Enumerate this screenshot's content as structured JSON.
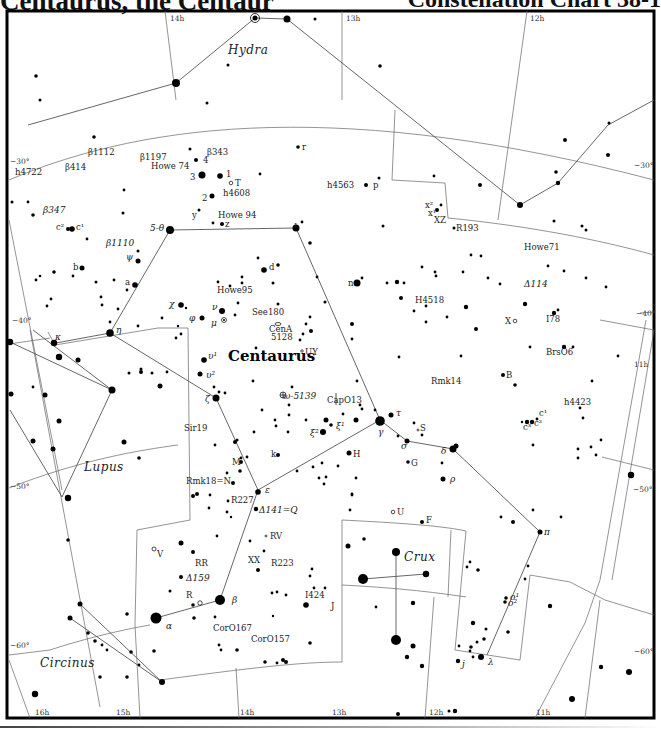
{
  "header": {
    "title_left": "Centaurus, the Centaur",
    "title_right": "Constellation Chart 38-1"
  },
  "chart": {
    "main_constellation": "Centaurus",
    "neighbor_constellations": [
      {
        "name": "Hydra",
        "x": 228,
        "y": 54
      },
      {
        "name": "Lupus",
        "x": 84,
        "y": 471
      },
      {
        "name": "Crux",
        "x": 404,
        "y": 561
      },
      {
        "name": "Circinus",
        "x": 40,
        "y": 667
      }
    ],
    "ra_labels": [
      {
        "text": "14h",
        "x": 170,
        "y": 21
      },
      {
        "text": "13h",
        "x": 346,
        "y": 21
      },
      {
        "text": "12h",
        "x": 530,
        "y": 21
      },
      {
        "text": "11h",
        "x": 634,
        "y": 367
      },
      {
        "text": "16h",
        "x": 35,
        "y": 715
      },
      {
        "text": "15h",
        "x": 116,
        "y": 715
      },
      {
        "text": "14h",
        "x": 240,
        "y": 715
      },
      {
        "text": "13h",
        "x": 332,
        "y": 715
      },
      {
        "text": "12h",
        "x": 429,
        "y": 715
      },
      {
        "text": "11h",
        "x": 536,
        "y": 715
      }
    ],
    "dec_labels": [
      {
        "text": "−30°",
        "x": 10,
        "y": 164
      },
      {
        "text": "−30°",
        "x": 634,
        "y": 168
      },
      {
        "text": "−40°",
        "x": 12,
        "y": 323
      },
      {
        "text": "−40°",
        "x": 636,
        "y": 316
      },
      {
        "text": "−50°",
        "x": 10,
        "y": 489
      },
      {
        "text": "−50°",
        "x": 633,
        "y": 492
      },
      {
        "text": "−60°",
        "x": 10,
        "y": 648
      },
      {
        "text": "−60°",
        "x": 634,
        "y": 654
      }
    ],
    "star_labels": [
      {
        "text": "β1112",
        "x": 88,
        "y": 155,
        "cls": "lbl"
      },
      {
        "text": "β414",
        "x": 65,
        "y": 170,
        "cls": "lbl"
      },
      {
        "text": "h4722",
        "x": 15,
        "y": 175,
        "cls": "lbl"
      },
      {
        "text": "β1197",
        "x": 140,
        "y": 160,
        "cls": "lbl"
      },
      {
        "text": "β343",
        "x": 207,
        "y": 155,
        "cls": "lbl"
      },
      {
        "text": "Howe 74",
        "x": 151,
        "y": 169,
        "cls": "lbl"
      },
      {
        "text": "4",
        "x": 203,
        "y": 163,
        "cls": "lbl"
      },
      {
        "text": "3",
        "x": 190,
        "y": 180,
        "cls": "lbl"
      },
      {
        "text": "1",
        "x": 226,
        "y": 177,
        "cls": "lbl"
      },
      {
        "text": "T",
        "x": 235,
        "y": 186,
        "cls": "lbl"
      },
      {
        "text": "h4608",
        "x": 223,
        "y": 196,
        "cls": "lbl"
      },
      {
        "text": "2",
        "x": 202,
        "y": 201,
        "cls": "lbl"
      },
      {
        "text": "r",
        "x": 302,
        "y": 150,
        "cls": "lbl"
      },
      {
        "text": "h4563",
        "x": 327,
        "y": 188,
        "cls": "lbl"
      },
      {
        "text": "p",
        "x": 373,
        "y": 188,
        "cls": "lbl"
      },
      {
        "text": "β347",
        "x": 43,
        "y": 213,
        "cls": "grk"
      },
      {
        "text": "c²",
        "x": 56,
        "y": 230,
        "cls": "lbl"
      },
      {
        "text": "c¹",
        "x": 76,
        "y": 230,
        "cls": "lbl"
      },
      {
        "text": "y",
        "x": 192,
        "y": 218,
        "cls": "lbl"
      },
      {
        "text": "Howe 94",
        "x": 218,
        "y": 218,
        "cls": "lbl"
      },
      {
        "text": "z",
        "x": 225,
        "y": 227,
        "cls": "lbl"
      },
      {
        "text": "5-θ",
        "x": 150,
        "y": 231,
        "cls": "grk"
      },
      {
        "text": "ι",
        "x": 294,
        "y": 228,
        "cls": "grk"
      },
      {
        "text": "x²",
        "x": 425,
        "y": 208,
        "cls": "lbl"
      },
      {
        "text": "x¹",
        "x": 428,
        "y": 216,
        "cls": "lbl"
      },
      {
        "text": "XZ",
        "x": 434,
        "y": 223,
        "cls": "lbl"
      },
      {
        "text": "R193",
        "x": 456,
        "y": 231,
        "cls": "lbl"
      },
      {
        "text": "Howe71",
        "x": 524,
        "y": 250,
        "cls": "lbl"
      },
      {
        "text": "β1110",
        "x": 106,
        "y": 246,
        "cls": "grk"
      },
      {
        "text": "ψ",
        "x": 126,
        "y": 260,
        "cls": "grk"
      },
      {
        "text": "b",
        "x": 73,
        "y": 270,
        "cls": "lbl"
      },
      {
        "text": "d",
        "x": 269,
        "y": 270,
        "cls": "lbl"
      },
      {
        "text": "n",
        "x": 348,
        "y": 286,
        "cls": "lbl"
      },
      {
        "text": "Δ114",
        "x": 524,
        "y": 287,
        "cls": "grk"
      },
      {
        "text": "a",
        "x": 125,
        "y": 285,
        "cls": "lbl"
      },
      {
        "text": "Howe95",
        "x": 217,
        "y": 293,
        "cls": "lbl"
      },
      {
        "text": "H4518",
        "x": 415,
        "y": 303,
        "cls": "lbl"
      },
      {
        "text": "χ",
        "x": 169,
        "y": 307,
        "cls": "grk"
      },
      {
        "text": "ν",
        "x": 212,
        "y": 310,
        "cls": "grk"
      },
      {
        "text": "See180",
        "x": 252,
        "y": 315,
        "cls": "lbl"
      },
      {
        "text": "φ",
        "x": 189,
        "y": 321,
        "cls": "grk"
      },
      {
        "text": "μ",
        "x": 211,
        "y": 326,
        "cls": "grk"
      },
      {
        "text": "CenA",
        "x": 269,
        "y": 332,
        "cls": "lbl"
      },
      {
        "text": "5128",
        "x": 271,
        "y": 340,
        "cls": "lbl"
      },
      {
        "text": "X",
        "x": 505,
        "y": 324,
        "cls": "lbl"
      },
      {
        "text": "I78",
        "x": 546,
        "y": 322,
        "cls": "lbl"
      },
      {
        "text": "η",
        "x": 116,
        "y": 333,
        "cls": "grk"
      },
      {
        "text": "κ",
        "x": 55,
        "y": 340,
        "cls": "grk"
      },
      {
        "text": "UY",
        "x": 305,
        "y": 355,
        "cls": "lbl"
      },
      {
        "text": "BrsO6",
        "x": 546,
        "y": 355,
        "cls": "lbl"
      },
      {
        "text": "υ¹",
        "x": 208,
        "y": 359,
        "cls": "grk"
      },
      {
        "text": "Rmk14",
        "x": 431,
        "y": 384,
        "cls": "lbl"
      },
      {
        "text": "υ²",
        "x": 206,
        "y": 378,
        "cls": "grk"
      },
      {
        "text": "B",
        "x": 506,
        "y": 378,
        "cls": "lbl"
      },
      {
        "text": "ω-5139",
        "x": 283,
        "y": 399,
        "cls": "grk"
      },
      {
        "text": "CapO13",
        "x": 327,
        "y": 403,
        "cls": "lbl"
      },
      {
        "text": "h4423",
        "x": 564,
        "y": 405,
        "cls": "lbl"
      },
      {
        "text": "τ",
        "x": 396,
        "y": 416,
        "cls": "grk"
      },
      {
        "text": "c¹",
        "x": 539,
        "y": 416,
        "cls": "lbl"
      },
      {
        "text": "c³",
        "x": 523,
        "y": 430,
        "cls": "lbl"
      },
      {
        "text": "c²",
        "x": 534,
        "y": 426,
        "cls": "lbl"
      },
      {
        "text": "ζ",
        "x": 205,
        "y": 402,
        "cls": "grk"
      },
      {
        "text": "S",
        "x": 420,
        "y": 431,
        "cls": "lbl"
      },
      {
        "text": "ξ²",
        "x": 310,
        "y": 436,
        "cls": "grk"
      },
      {
        "text": "ξ¹",
        "x": 336,
        "y": 429,
        "cls": "grk"
      },
      {
        "text": "γ",
        "x": 378,
        "y": 435,
        "cls": "grk"
      },
      {
        "text": "Sir19",
        "x": 184,
        "y": 431,
        "cls": "lbl"
      },
      {
        "text": "σ",
        "x": 401,
        "y": 449,
        "cls": "grk"
      },
      {
        "text": "δ",
        "x": 441,
        "y": 454,
        "cls": "grk"
      },
      {
        "text": "k",
        "x": 271,
        "y": 457,
        "cls": "lbl"
      },
      {
        "text": "H",
        "x": 353,
        "y": 457,
        "cls": "lbl"
      },
      {
        "text": "G",
        "x": 411,
        "y": 466,
        "cls": "lbl"
      },
      {
        "text": "M",
        "x": 232,
        "y": 465,
        "cls": "lbl"
      },
      {
        "text": "ρ",
        "x": 450,
        "y": 482,
        "cls": "grk"
      },
      {
        "text": "Rmk18=N",
        "x": 186,
        "y": 484,
        "cls": "lbl"
      },
      {
        "text": "ε",
        "x": 265,
        "y": 493,
        "cls": "grk"
      },
      {
        "text": "R227",
        "x": 231,
        "y": 503,
        "cls": "lbl"
      },
      {
        "text": "Δ141=Q",
        "x": 259,
        "y": 513,
        "cls": "grk"
      },
      {
        "text": "U",
        "x": 397,
        "y": 515,
        "cls": "lbl"
      },
      {
        "text": "F",
        "x": 426,
        "y": 523,
        "cls": "lbl"
      },
      {
        "text": "π",
        "x": 544,
        "y": 535,
        "cls": "grk"
      },
      {
        "text": "RV",
        "x": 270,
        "y": 539,
        "cls": "lbl"
      },
      {
        "text": "V",
        "x": 157,
        "y": 557,
        "cls": "lbl"
      },
      {
        "text": "XX",
        "x": 248,
        "y": 563,
        "cls": "lbl"
      },
      {
        "text": "R223",
        "x": 271,
        "y": 566,
        "cls": "lbl"
      },
      {
        "text": "RR",
        "x": 195,
        "y": 566,
        "cls": "lbl"
      },
      {
        "text": "Δ159",
        "x": 186,
        "y": 581,
        "cls": "grk"
      },
      {
        "text": "R",
        "x": 186,
        "y": 598,
        "cls": "lbl"
      },
      {
        "text": "I424",
        "x": 305,
        "y": 598,
        "cls": "lbl"
      },
      {
        "text": "β",
        "x": 232,
        "y": 603,
        "cls": "grk"
      },
      {
        "text": "J",
        "x": 331,
        "y": 609,
        "cls": "lbl"
      },
      {
        "text": "o¹",
        "x": 510,
        "y": 600,
        "cls": "grk"
      },
      {
        "text": "o²",
        "x": 508,
        "y": 606,
        "cls": "grk"
      },
      {
        "text": "α",
        "x": 166,
        "y": 629,
        "cls": "grk"
      },
      {
        "text": "CorO167",
        "x": 213,
        "y": 631,
        "cls": "lbl"
      },
      {
        "text": "CorO157",
        "x": 251,
        "y": 642,
        "cls": "lbl"
      },
      {
        "text": "λ",
        "x": 488,
        "y": 665,
        "cls": "grk"
      },
      {
        "text": "j",
        "x": 462,
        "y": 667,
        "cls": "grk"
      }
    ]
  }
}
